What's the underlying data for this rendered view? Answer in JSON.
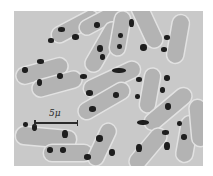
{
  "image": {
    "type": "grayscale micrograph",
    "subject": "rod-shaped bacterial cells with dark nuclear bodies",
    "background_color": "#c9c9c9",
    "cell_color": "#b3b3b3",
    "nuclear_body_color": "#1e1e1e"
  },
  "scale_bar": {
    "label": "5μ"
  },
  "cells": [
    {
      "x": 36,
      "y": 8,
      "w": 50,
      "h": 15,
      "rot": -28
    },
    {
      "x": 64,
      "y": 2,
      "w": 46,
      "h": 14,
      "rot": -28
    },
    {
      "x": 2,
      "y": 52,
      "w": 52,
      "h": 16,
      "rot": -15
    },
    {
      "x": 18,
      "y": 65,
      "w": 50,
      "h": 16,
      "rot": -15
    },
    {
      "x": 62,
      "y": 28,
      "w": 54,
      "h": 16,
      "rot": -60
    },
    {
      "x": 84,
      "y": 15,
      "w": 44,
      "h": 15,
      "rot": -80
    },
    {
      "x": 108,
      "y": 5,
      "w": 50,
      "h": 16,
      "rot": 65
    },
    {
      "x": 140,
      "y": 20,
      "w": 48,
      "h": 16,
      "rot": -80
    },
    {
      "x": 68,
      "y": 60,
      "w": 60,
      "h": 16,
      "rot": -25
    },
    {
      "x": 62,
      "y": 82,
      "w": 56,
      "h": 16,
      "rot": -30
    },
    {
      "x": 114,
      "y": 72,
      "w": 44,
      "h": 15,
      "rot": -80
    },
    {
      "x": 126,
      "y": 90,
      "w": 56,
      "h": 16,
      "rot": -40
    },
    {
      "x": 2,
      "y": 118,
      "w": 60,
      "h": 17,
      "rot": 5
    },
    {
      "x": 30,
      "y": 134,
      "w": 48,
      "h": 16,
      "rot": 0
    },
    {
      "x": 66,
      "y": 126,
      "w": 44,
      "h": 15,
      "rot": -65
    },
    {
      "x": 110,
      "y": 130,
      "w": 48,
      "h": 16,
      "rot": -50
    },
    {
      "x": 150,
      "y": 120,
      "w": 46,
      "h": 16,
      "rot": -80
    },
    {
      "x": 162,
      "y": 104,
      "w": 46,
      "h": 16,
      "rot": 85
    }
  ],
  "nuclear_bodies": [
    {
      "x": 44,
      "y": 16,
      "w": 7,
      "h": 5
    },
    {
      "x": 34,
      "y": 27,
      "w": 6,
      "h": 5
    },
    {
      "x": 58,
      "y": 23,
      "w": 7,
      "h": 6
    },
    {
      "x": 80,
      "y": 11,
      "w": 6,
      "h": 6
    },
    {
      "x": 83,
      "y": 34,
      "w": 6,
      "h": 7
    },
    {
      "x": 86,
      "y": 43,
      "w": 5,
      "h": 6
    },
    {
      "x": 115,
      "y": 8,
      "w": 5,
      "h": 8
    },
    {
      "x": 104,
      "y": 22,
      "w": 5,
      "h": 5
    },
    {
      "x": 103,
      "y": 33,
      "w": 5,
      "h": 5
    },
    {
      "x": 126,
      "y": 33,
      "w": 7,
      "h": 7
    },
    {
      "x": 150,
      "y": 24,
      "w": 6,
      "h": 5
    },
    {
      "x": 147,
      "y": 36,
      "w": 6,
      "h": 5
    },
    {
      "x": 23,
      "y": 48,
      "w": 7,
      "h": 5
    },
    {
      "x": 8,
      "y": 56,
      "w": 6,
      "h": 6
    },
    {
      "x": 23,
      "y": 68,
      "w": 5,
      "h": 7
    },
    {
      "x": 43,
      "y": 62,
      "w": 6,
      "h": 6
    },
    {
      "x": 66,
      "y": 63,
      "w": 7,
      "h": 5
    },
    {
      "x": 98,
      "y": 57,
      "w": 14,
      "h": 5
    },
    {
      "x": 122,
      "y": 66,
      "w": 6,
      "h": 5
    },
    {
      "x": 150,
      "y": 64,
      "w": 6,
      "h": 6
    },
    {
      "x": 146,
      "y": 76,
      "w": 5,
      "h": 6
    },
    {
      "x": 72,
      "y": 79,
      "w": 7,
      "h": 6
    },
    {
      "x": 99,
      "y": 81,
      "w": 6,
      "h": 6
    },
    {
      "x": 121,
      "y": 83,
      "w": 5,
      "h": 5
    },
    {
      "x": 75,
      "y": 95,
      "w": 7,
      "h": 6
    },
    {
      "x": 151,
      "y": 92,
      "w": 6,
      "h": 7
    },
    {
      "x": 9,
      "y": 111,
      "w": 5,
      "h": 5
    },
    {
      "x": 18,
      "y": 113,
      "w": 5,
      "h": 7
    },
    {
      "x": 48,
      "y": 119,
      "w": 6,
      "h": 8
    },
    {
      "x": 123,
      "y": 109,
      "w": 12,
      "h": 5
    },
    {
      "x": 163,
      "y": 110,
      "w": 5,
      "h": 5
    },
    {
      "x": 33,
      "y": 136,
      "w": 6,
      "h": 6
    },
    {
      "x": 46,
      "y": 136,
      "w": 6,
      "h": 6
    },
    {
      "x": 82,
      "y": 124,
      "w": 7,
      "h": 7
    },
    {
      "x": 148,
      "y": 119,
      "w": 7,
      "h": 5
    },
    {
      "x": 167,
      "y": 123,
      "w": 6,
      "h": 6
    },
    {
      "x": 95,
      "y": 138,
      "w": 6,
      "h": 7
    },
    {
      "x": 70,
      "y": 143,
      "w": 7,
      "h": 6
    },
    {
      "x": 122,
      "y": 133,
      "w": 6,
      "h": 8
    },
    {
      "x": 150,
      "y": 131,
      "w": 6,
      "h": 8
    }
  ]
}
